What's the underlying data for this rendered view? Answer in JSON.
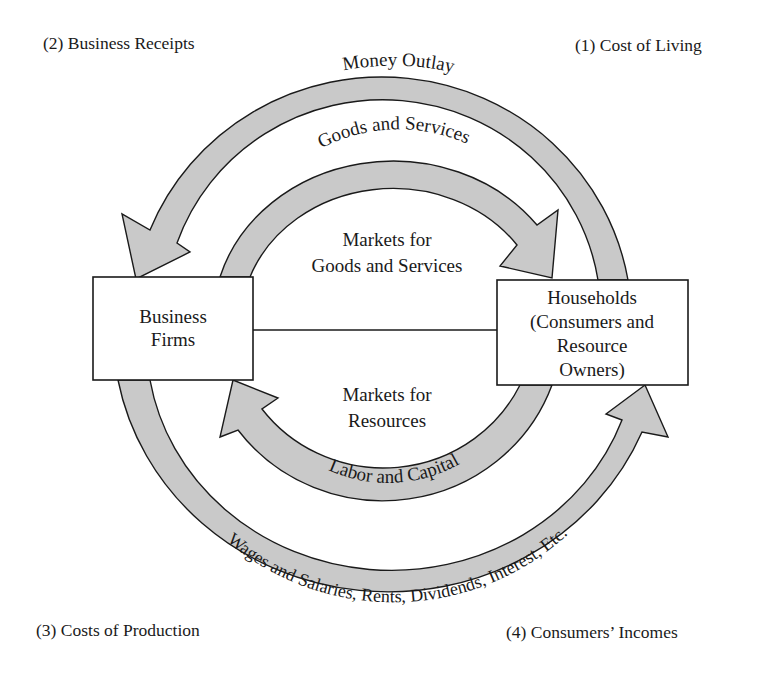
{
  "corners": {
    "top_left": "(2) Business Receipts",
    "top_right": "(1) Cost of Living",
    "bottom_left": "(3) Costs of Production",
    "bottom_right": "(4) Consumers’ Incomes"
  },
  "boxes": {
    "business": {
      "line1": "Business",
      "line2": "Firms"
    },
    "households": {
      "line1": "Households",
      "line2": "(Consumers and",
      "line3": "Resource",
      "line4": "Owners)"
    }
  },
  "markets": {
    "goods": {
      "line1": "Markets for",
      "line2": "Goods and Services"
    },
    "resources": {
      "line1": "Markets for",
      "line2": "Resources"
    }
  },
  "flows": {
    "money_outlay": "Money Outlay",
    "goods_services": "Goods and Services",
    "labor_capital": "Labor and Capital",
    "incomes": "Wages and Salaries, Rents, Dividends, Interest, Etc."
  },
  "colors": {
    "flow_fill": "#c9c9c9",
    "stroke": "#1a1a1a",
    "background": "#ffffff"
  }
}
